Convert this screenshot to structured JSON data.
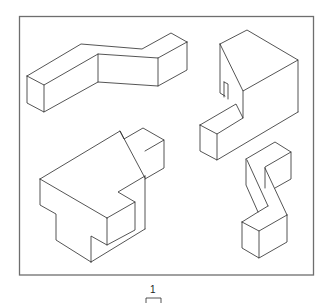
{
  "figure": {
    "caption_number": "1",
    "colors": {
      "line": "#2a2a2a",
      "frame": "#6e6e6e",
      "background": "#ffffff"
    }
  },
  "shapes": [
    {
      "id": "top-left",
      "name": "z-shaped-bar"
    },
    {
      "id": "top-right",
      "name": "notched-block"
    },
    {
      "id": "bottom-left",
      "name": "stepped-block-with-tab"
    },
    {
      "id": "bottom-right",
      "name": "s-shaped-column"
    }
  ]
}
